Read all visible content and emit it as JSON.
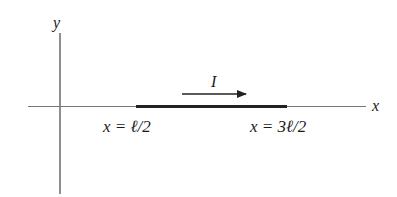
{
  "diagram": {
    "axes": {
      "x_label": "x",
      "y_label": "y"
    },
    "conductor": {
      "current_label": "I",
      "start_label": "x = ℓ/2",
      "end_label": "x = 3ℓ/2"
    },
    "colors": {
      "axis": "#555555",
      "conductor": "#222222",
      "text": "#1a1a1a"
    }
  }
}
